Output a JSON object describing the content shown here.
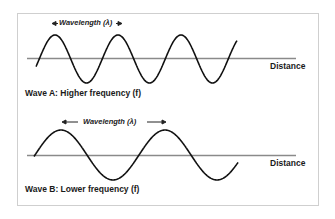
{
  "diagram": {
    "wave_a": {
      "label": "Wave A:  Higher frequency (f)",
      "axis_label": "Distance",
      "wavelength_label": "Wavelength (λ)",
      "period_px": 63,
      "amplitude_px": 24
    },
    "wave_b": {
      "label": "Wave B:  Lower frequency (f)",
      "axis_label": "Distance",
      "wavelength_label": "Wavelength (λ)",
      "period_px": 104,
      "amplitude_px": 25
    },
    "colors": {
      "wave": "#111111",
      "axis": "#888888",
      "border": "#cfcfcf"
    }
  }
}
